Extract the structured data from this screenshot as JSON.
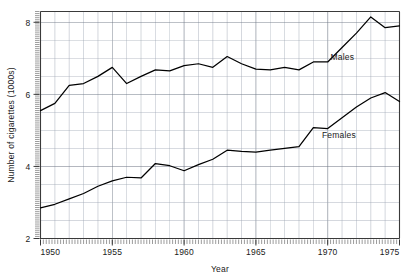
{
  "chart_data": {
    "type": "line",
    "title": "",
    "subtitle": "",
    "xlabel": "Year",
    "ylabel": "Number of cigarettes (1000s)",
    "xlim": [
      1950,
      1975
    ],
    "ylim": [
      2,
      8.3
    ],
    "grid": true,
    "legend_position": "inline-annotation",
    "x": [
      1950,
      1951,
      1952,
      1953,
      1954,
      1955,
      1956,
      1957,
      1958,
      1959,
      1960,
      1961,
      1962,
      1963,
      1964,
      1965,
      1966,
      1967,
      1968,
      1969,
      1970,
      1971,
      1972,
      1973,
      1974,
      1975
    ],
    "xtick_labels": [
      "1950",
      "1955",
      "1960",
      "1965",
      "1970",
      "1975"
    ],
    "xtick_values": [
      1950,
      1955,
      1960,
      1965,
      1970,
      1975
    ],
    "ytick_labels": [
      "2",
      "4",
      "6",
      "8"
    ],
    "ytick_values": [
      2,
      4,
      6,
      8
    ],
    "series": [
      {
        "name": "Males",
        "label": "Males",
        "color": "#000000",
        "label_x": 1970.2,
        "label_y": 6.95,
        "values": [
          5.55,
          5.75,
          6.25,
          6.3,
          6.5,
          6.75,
          6.3,
          6.5,
          6.68,
          6.65,
          6.8,
          6.85,
          6.75,
          7.05,
          6.85,
          6.7,
          6.68,
          6.75,
          6.68,
          6.9,
          6.9,
          7.3,
          7.7,
          8.15,
          7.85,
          7.9
        ]
      },
      {
        "name": "Females",
        "label": "Females",
        "color": "#000000",
        "label_x": 1969.6,
        "label_y": 4.78,
        "values": [
          2.85,
          2.95,
          3.1,
          3.25,
          3.45,
          3.6,
          3.7,
          3.68,
          4.08,
          4.02,
          3.88,
          4.05,
          4.2,
          4.45,
          4.42,
          4.4,
          4.45,
          4.5,
          4.55,
          5.08,
          5.05,
          5.35,
          5.65,
          5.9,
          6.05,
          5.8
        ]
      }
    ]
  },
  "axes": {
    "x_title": "Year",
    "y_title": "Number of cigarettes (1000s)"
  }
}
